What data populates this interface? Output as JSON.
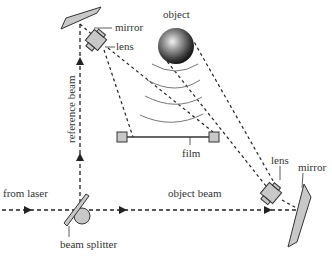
{
  "labels": {
    "mirror_top": "mirror",
    "lens_top": "lens",
    "object": "object",
    "film": "film",
    "lens_right": "lens",
    "mirror_right": "mirror",
    "from_laser": "from laser",
    "object_beam": "object beam",
    "beam_splitter": "beam splitter",
    "reference_beam": "reference beam"
  },
  "colors": {
    "component_fill": "#c8c8c8",
    "stroke": "#333333",
    "beam": "#222222",
    "wave": "#777777",
    "text": "#333333"
  }
}
